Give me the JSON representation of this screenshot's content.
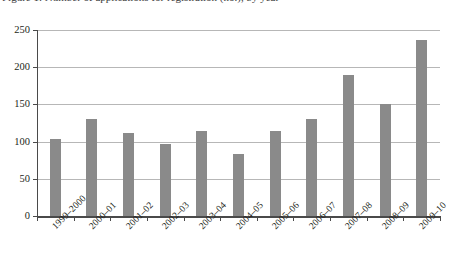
{
  "figure": {
    "caption_partial": "Figure 1: Number of applications for registration (no.), by year"
  },
  "chart_data": {
    "type": "bar",
    "title": "",
    "subtitle": "",
    "xlabel": "",
    "ylabel": "",
    "categories": [
      "1999–2000",
      "2000–01",
      "2001–02",
      "2002–03",
      "2003–04",
      "2004–05",
      "2005–06",
      "2006–07",
      "2007–08",
      "2008–09",
      "2009–10"
    ],
    "values": [
      103,
      130,
      111,
      97,
      114,
      83,
      114,
      131,
      189,
      150,
      236
    ],
    "ylim": [
      0,
      250
    ],
    "yticks": [
      0,
      50,
      100,
      150,
      200,
      250
    ],
    "ytick_labels": [
      "0",
      "50",
      "100",
      "150",
      "200",
      "250"
    ],
    "grid": true,
    "grid_axis": "y",
    "legend": false,
    "legend_position": "none",
    "bar_color": "#8a8a8a",
    "axis_color": "#4a4a4a",
    "grid_color": "#b7b7b7",
    "background_color": "#ffffff"
  }
}
